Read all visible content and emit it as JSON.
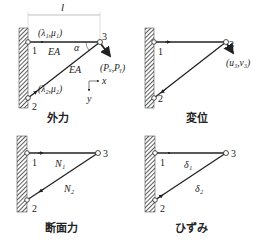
{
  "colors": {
    "line": "#222222",
    "hatch": "#333333",
    "node_fill": "#ffffff"
  },
  "panels": [
    {
      "caption": "外力",
      "nodes": [
        "1",
        "2",
        "3"
      ],
      "dimension_label": "l",
      "member1_label": "EA",
      "member2_label": "EA",
      "angle_label": "α",
      "node1_param": "(λ₁,μ₁)",
      "node2_param": "(λ₂,μ₂)",
      "load_label": "(Pₓ,Pᵧ)",
      "axis_x": "x",
      "axis_y": "y"
    },
    {
      "caption": "変位",
      "nodes": [
        "1",
        "2",
        "3"
      ],
      "displacement_label": "(u₃,v₃)"
    },
    {
      "caption": "断面力",
      "nodes": [
        "1",
        "2",
        "3"
      ],
      "member1_label": "N₁",
      "member2_label": "N₂"
    },
    {
      "caption": "ひずみ",
      "nodes": [
        "1",
        "2",
        "3"
      ],
      "member1_label": "δ₁",
      "member2_label": "δ₂"
    }
  ]
}
